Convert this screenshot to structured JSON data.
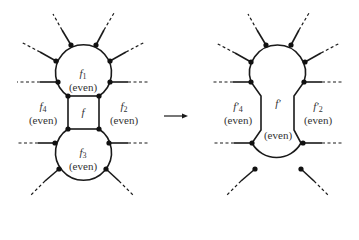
{
  "figure": {
    "left": {
      "faces": [
        {
          "id": "f1",
          "name": "f",
          "sub": "1",
          "parity": "(even)"
        },
        {
          "id": "f2",
          "name": "f",
          "sub": "2",
          "parity": "(even)"
        },
        {
          "id": "f3",
          "name": "f",
          "sub": "3",
          "parity": "(even)"
        },
        {
          "id": "f4",
          "name": "f",
          "sub": "4",
          "parity": "(even)"
        },
        {
          "id": "f",
          "name": "f",
          "sub": "",
          "parity": ""
        }
      ]
    },
    "arrow": "→",
    "right": {
      "faces": [
        {
          "id": "f4p",
          "name": "f′",
          "sub": "4",
          "parity": "(even)"
        },
        {
          "id": "f2p",
          "name": "f′",
          "sub": "2",
          "parity": "(even)"
        },
        {
          "id": "fp",
          "name": "f′",
          "sub": "",
          "parity": "(even)"
        }
      ]
    }
  }
}
